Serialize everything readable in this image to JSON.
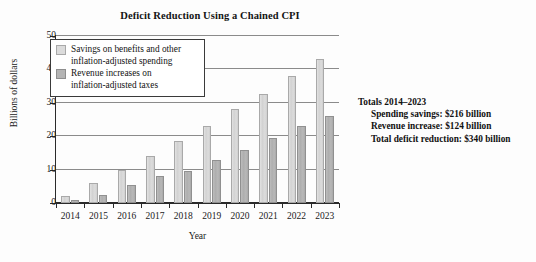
{
  "chart_data": {
    "type": "bar",
    "title": "Deficit Reduction Using a Chained CPI",
    "xlabel": "Year",
    "ylabel": "Billions of dollars",
    "ylim": [
      0,
      50
    ],
    "yticks": [
      0,
      10,
      20,
      30,
      40,
      50
    ],
    "grid": true,
    "legend_position": "upper-left inside plot",
    "categories": [
      "2014",
      "2015",
      "2016",
      "2017",
      "2018",
      "2019",
      "2020",
      "2021",
      "2022",
      "2023"
    ],
    "series": [
      {
        "name": "Savings on benefits and other inflation-adjusted spending",
        "color": "#dcdcdc",
        "values": [
          2,
          6,
          10,
          14,
          18.5,
          23,
          28,
          32.5,
          38,
          43
        ]
      },
      {
        "name": "Revenue increases on inflation-adjusted taxes",
        "color": "#b4b4b4",
        "values": [
          1,
          2.5,
          5.5,
          8,
          9.5,
          13,
          16,
          19.5,
          23,
          26
        ]
      }
    ],
    "annotations": [
      "Totals 2014–2023",
      "Spending savings: $216 billion",
      "Revenue increase: $124 billion",
      "Total deficit reduction: $340 billion"
    ]
  },
  "legend": {
    "entries": [
      {
        "label": "Savings on benefits and other inflation-adjusted spending",
        "swatch": "light-gray-swatch"
      },
      {
        "label": "Revenue increases on inflation-adjusted taxes",
        "swatch": "medium-gray-swatch"
      }
    ]
  },
  "totals": {
    "heading": "Totals 2014–2023",
    "line1": "Spending savings: $216 billion",
    "line2": "Revenue increase: $124 billion",
    "line3": "Total deficit reduction: $340 billion"
  }
}
